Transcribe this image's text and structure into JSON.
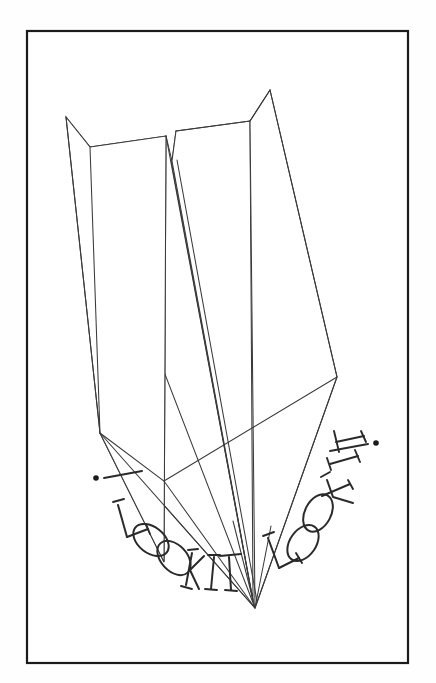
{
  "artwork": {
    "title": "Paper Airplane Line Drawing",
    "subject": "paper-airplane",
    "style": "ink-line-drawing",
    "background_color": "#fefefe",
    "ink_color": "#3a3a3a",
    "frame_color": "#1b1b1b",
    "lettering_color": "#2a2a2a"
  },
  "frame": {
    "name": "border-rectangle",
    "x": 27,
    "y": 31,
    "width": 381,
    "height": 632,
    "stroke_width": 2.2
  },
  "airplane": {
    "name": "paper-airplane",
    "nose_point": {
      "x": 255,
      "y": 608
    },
    "left_wing_tip": {
      "x": 66,
      "y": 117
    },
    "right_wing_tip": {
      "x": 270,
      "y": 90
    },
    "left_wing_rear_corner": {
      "x": 100,
      "y": 433
    },
    "right_wing_rear_corner": {
      "x": 337,
      "y": 377
    },
    "center_notch": {
      "x": 168,
      "y": 135
    }
  },
  "lettering": {
    "left_text": "! LOOKIT",
    "right_text": "LOOKIT !",
    "left_letters": [
      "L",
      "O",
      "O",
      "K",
      "I",
      "T"
    ],
    "right_letters": [
      "L",
      "O",
      "O",
      "K",
      "I",
      "T"
    ],
    "left_bang": "!",
    "right_bang": "!",
    "full_caption": "! LOOKIT    LOOKIT !",
    "font_style": "outline-serif-capitals",
    "arrangement": "curved-arc"
  }
}
